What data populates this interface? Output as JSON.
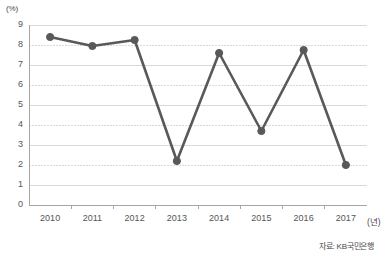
{
  "chart_data": {
    "type": "line",
    "title": "",
    "subtitle": "",
    "xlabel": "(년)",
    "ylabel": "(%)",
    "categories": [
      "2010",
      "2011",
      "2012",
      "2013",
      "2014",
      "2015",
      "2016",
      "2017"
    ],
    "values": [
      8.4,
      7.95,
      8.25,
      2.2,
      7.6,
      3.7,
      7.75,
      2.0
    ],
    "series": [
      {
        "name": "",
        "values": [
          8.4,
          7.95,
          8.25,
          2.2,
          7.6,
          3.7,
          7.75,
          2.0
        ]
      }
    ],
    "ylim": [
      0,
      9
    ],
    "yticks": [
      "0",
      "1",
      "2",
      "3",
      "4",
      "5",
      "6",
      "7",
      "8",
      "9"
    ],
    "grid": true,
    "legend": "none",
    "annotations": [
      "자료: KB국민은행"
    ],
    "line_color": "#595959",
    "marker_color": "#595959",
    "grid_color": "#d9d9d9",
    "axis_color": "#a6a6a6"
  },
  "axes": {
    "y_unit": "(%)",
    "x_unit": "(년)"
  },
  "footer": {
    "source": "자료: KB국민은행"
  }
}
